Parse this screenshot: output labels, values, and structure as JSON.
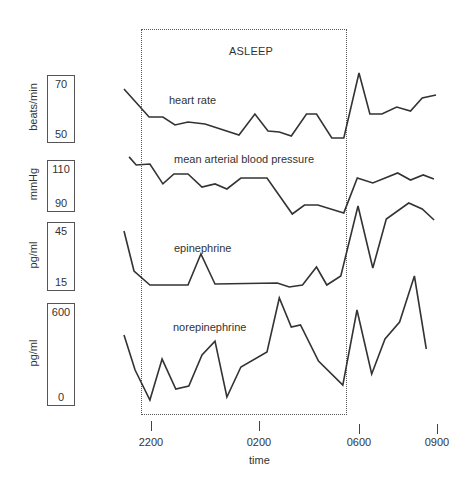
{
  "chart_data": {
    "type": "line",
    "title": "",
    "xlabel": "time",
    "x_ticks": [
      {
        "label": "2200",
        "hour": 0
      },
      {
        "label": "0200",
        "hour": 4
      },
      {
        "label": "0600",
        "hour": 8
      },
      {
        "label": "0900",
        "hour": 11
      }
    ],
    "x_unit": "hours since 2200",
    "shaded_region": {
      "label": "ASLEEP",
      "start_hour": -0.35,
      "end_hour": 7.5,
      "style": "dotted box"
    },
    "grid": false,
    "legend": "inline labels",
    "series": [
      {
        "name": "heart rate",
        "unit": "beats/min",
        "scale": {
          "top": 70,
          "bottom": 50
        },
        "points": [
          [
            -1.0,
            68
          ],
          [
            -0.07,
            56.8
          ],
          [
            0.44,
            56.8
          ],
          [
            0.89,
            53.6
          ],
          [
            1.37,
            54.8
          ],
          [
            2.0,
            54
          ],
          [
            3.26,
            49.6
          ],
          [
            3.85,
            58
          ],
          [
            4.36,
            51.2
          ],
          [
            4.81,
            50.8
          ],
          [
            5.29,
            49.2
          ],
          [
            5.9,
            58
          ],
          [
            6.3,
            58
          ],
          [
            6.91,
            48.4
          ],
          [
            7.39,
            48.4
          ],
          [
            8.0,
            74.4
          ],
          [
            8.42,
            58
          ],
          [
            8.88,
            58
          ],
          [
            9.45,
            60.8
          ],
          [
            9.98,
            59.2
          ],
          [
            10.43,
            64.4
          ],
          [
            10.96,
            65.6
          ]
        ]
      },
      {
        "name": "mean arterial blood pressure",
        "unit": "mmHg",
        "scale": {
          "top": 110,
          "bottom": 90
        },
        "points": [
          [
            -0.81,
            116.7
          ],
          [
            -0.55,
            112.2
          ],
          [
            -0.04,
            112.8
          ],
          [
            0.44,
            101.7
          ],
          [
            0.85,
            107.2
          ],
          [
            1.37,
            107.2
          ],
          [
            1.89,
            100
          ],
          [
            2.37,
            101.7
          ],
          [
            2.81,
            98.9
          ],
          [
            3.33,
            105
          ],
          [
            4.32,
            105
          ],
          [
            5.33,
            85
          ],
          [
            5.82,
            90
          ],
          [
            6.35,
            90
          ],
          [
            7.39,
            85.6
          ],
          [
            7.93,
            105
          ],
          [
            8.53,
            102.2
          ],
          [
            9.49,
            107.8
          ],
          [
            9.98,
            103.9
          ],
          [
            10.47,
            106.7
          ],
          [
            10.88,
            104.4
          ]
        ]
      },
      {
        "name": "epinephrine",
        "unit": "pg/ml",
        "scale": {
          "top": 45,
          "bottom": 15
        },
        "points": [
          [
            -1.0,
            46.2
          ],
          [
            -0.63,
            22.2
          ],
          [
            -0.04,
            13.8
          ],
          [
            1.37,
            13.8
          ],
          [
            1.85,
            32.4
          ],
          [
            2.37,
            14.4
          ],
          [
            4.73,
            15
          ],
          [
            5.21,
            12.6
          ],
          [
            5.74,
            13.8
          ],
          [
            6.3,
            24.6
          ],
          [
            6.71,
            13.8
          ],
          [
            7.27,
            19.2
          ],
          [
            7.96,
            61.2
          ],
          [
            8.53,
            24
          ],
          [
            9.05,
            53.4
          ],
          [
            9.91,
            63
          ],
          [
            10.43,
            59.4
          ],
          [
            10.89,
            52.8
          ]
        ]
      },
      {
        "name": "norepinephrine",
        "unit": "pg/ml",
        "scale": {
          "top": 600,
          "bottom": 0
        },
        "points": [
          [
            -1.0,
            446
          ],
          [
            -0.59,
            190
          ],
          [
            -0.04,
            -29
          ],
          [
            0.41,
            270
          ],
          [
            0.92,
            51
          ],
          [
            1.4,
            73
          ],
          [
            1.89,
            300
          ],
          [
            2.37,
            402
          ],
          [
            2.81,
            -7
          ],
          [
            3.33,
            212
          ],
          [
            4.32,
            322
          ],
          [
            4.81,
            717
          ],
          [
            5.29,
            505
          ],
          [
            5.66,
            520
          ],
          [
            6.38,
            256
          ],
          [
            7.35,
            80
          ],
          [
            7.92,
            629
          ],
          [
            8.49,
            161
          ],
          [
            9.0,
            417
          ],
          [
            9.56,
            541
          ],
          [
            10.13,
            878
          ],
          [
            10.59,
            344
          ]
        ]
      }
    ]
  },
  "labels": {
    "asleep": "ASLEEP",
    "hr_series": "heart rate",
    "map_series": "mean arterial blood pressure",
    "epi_series": "epinephrine",
    "ne_series": "norepinephrine",
    "time": "time"
  },
  "scales": [
    {
      "unit": "beats/min",
      "top": "70",
      "bottom": "50"
    },
    {
      "unit": "mmHg",
      "top": "110",
      "bottom": "90"
    },
    {
      "unit": "pg/ml",
      "top": "45",
      "bottom": "15"
    },
    {
      "unit": "pg/ml",
      "top": "600",
      "bottom": "0"
    }
  ],
  "ticks": [
    "2200",
    "0200",
    "0600",
    "0900"
  ],
  "colors": {
    "line": "#333333",
    "box": "#555555",
    "text": "#333333"
  }
}
